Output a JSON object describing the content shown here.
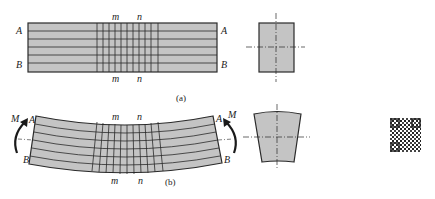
{
  "figure": {
    "panel_a": {
      "caption": "(a)",
      "labels": {
        "top_left": "A",
        "bottom_left": "B",
        "top_right": "A",
        "bottom_right": "B",
        "top_m": "m",
        "top_n": "n",
        "bottom_m": "m",
        "bottom_n": "n"
      },
      "description": "Undeformed beam with longitudinal lines and transverse grid; rectangular cross-section"
    },
    "panel_b": {
      "caption": "(b)",
      "labels": {
        "top_left": "A",
        "bottom_left": "B",
        "top_right": "A",
        "bottom_right": "B",
        "top_m": "m",
        "top_n": "n",
        "bottom_m": "m",
        "bottom_n": "n",
        "moment_left": "M",
        "moment_right": "M"
      },
      "description": "Beam under pure bending moment M; deformed grid and trapezoidal cross-section"
    },
    "colors": {
      "fill": "#c4c4c4",
      "stroke": "#2a2a2a",
      "background": "#ffffff"
    },
    "qr_code": {
      "present": true
    }
  }
}
